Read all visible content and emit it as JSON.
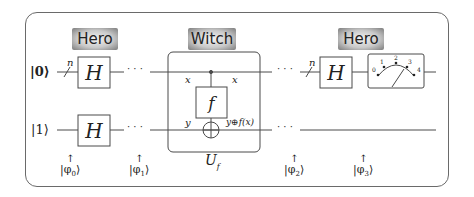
{
  "badges": [
    {
      "label": "Hero"
    },
    {
      "label": "Witch"
    },
    {
      "label": "Hero"
    }
  ],
  "inputs": {
    "top": "|0⟩",
    "bottom": "|1⟩"
  },
  "register_size": "n",
  "gates": {
    "hadamard": "H",
    "oracle_inner": "f",
    "oracle_label": "U",
    "oracle_label_sub": "f"
  },
  "oracle_wire_labels": {
    "top_in": "x",
    "top_out": "x",
    "bottom_in": "y",
    "bottom_out": "y⊕f(x)"
  },
  "ellipsis": "· · ·",
  "meter": {
    "scale_labels": [
      "0",
      "1",
      "2",
      "3",
      "4"
    ]
  },
  "states": [
    {
      "label": "|φ",
      "sub": "0",
      "close": "⟩"
    },
    {
      "label": "|φ",
      "sub": "1",
      "close": "⟩"
    },
    {
      "label": "|φ",
      "sub": "2",
      "close": "⟩"
    },
    {
      "label": "|φ",
      "sub": "3",
      "close": "⟩"
    }
  ],
  "colors": {
    "stroke": "#4a4a4a",
    "frame": "#6a6a6a",
    "badge_dark": "#7c7c7c",
    "badge_light": "#f4f4f4"
  }
}
